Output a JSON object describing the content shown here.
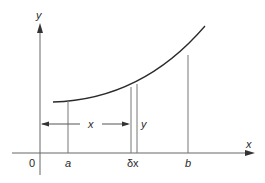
{
  "diagram": {
    "axes": {
      "x_label": "x",
      "y_label": "y",
      "origin_label": "0"
    },
    "points": {
      "a_label": "a",
      "b_label": "b",
      "dx_label": "δx"
    },
    "annotations": {
      "distance_label": "x",
      "strip_height_label": "y"
    },
    "colors": {
      "curve": "#2a2a2a",
      "axis": "#555555",
      "guide": "#777777"
    }
  }
}
